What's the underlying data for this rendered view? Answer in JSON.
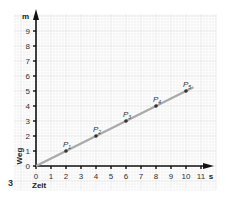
{
  "figure_number": "3",
  "chart_data": {
    "type": "line",
    "title": "",
    "xlabel": "Zeit",
    "ylabel": "Weg",
    "x_unit": "s",
    "y_unit": "m",
    "xlim": [
      0,
      11
    ],
    "ylim": [
      0,
      9
    ],
    "x_ticks": [
      "0",
      "1",
      "2",
      "3",
      "4",
      "5",
      "6",
      "7",
      "8",
      "9",
      "10",
      "11"
    ],
    "y_ticks": [
      "0",
      "1",
      "2",
      "3",
      "4",
      "5",
      "6",
      "7",
      "8",
      "9"
    ],
    "grid": true,
    "series": [
      {
        "name": "Weg-Zeit-Gerade",
        "x": [
          0,
          10.5
        ],
        "y": [
          0,
          5.25
        ]
      }
    ],
    "points": [
      {
        "label": "P1",
        "x": 2,
        "y": 1
      },
      {
        "label": "P2",
        "x": 4,
        "y": 2
      },
      {
        "label": "P3",
        "x": 6,
        "y": 3
      },
      {
        "label": "P4",
        "x": 8,
        "y": 4
      },
      {
        "label": "P5",
        "x": 10,
        "y": 5
      }
    ],
    "colors": {
      "line": "#a8a8a8",
      "axis": "#111111",
      "grid": "#e6e6e6",
      "point": "#333333"
    }
  }
}
